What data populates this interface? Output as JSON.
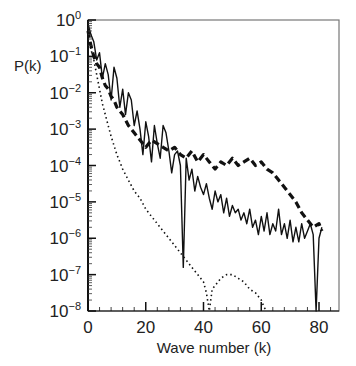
{
  "chart_data": {
    "type": "line",
    "title": "",
    "xlabel": "Wave number (k)",
    "ylabel": "P(k)",
    "xlim": [
      0,
      87
    ],
    "ylim_log10": [
      -8,
      0
    ],
    "yscale": "log",
    "grid": false,
    "legend": null,
    "x_ticks": [
      0,
      20,
      40,
      60,
      80
    ],
    "x_tick_labels": [
      "0",
      "20",
      "40",
      "60",
      "80"
    ],
    "y_ticks_log10": [
      0,
      -1,
      -2,
      -3,
      -4,
      -5,
      -6,
      -7,
      -8
    ],
    "y_tick_labels": [
      "10^0",
      "10^-1",
      "10^-2",
      "10^-3",
      "10^-4",
      "10^-5",
      "10^-6",
      "10^-7",
      "10^-8"
    ],
    "series": [
      {
        "name": "solid",
        "style": "solid",
        "color": "#111111",
        "x": [
          0,
          1,
          2,
          3,
          4,
          5,
          6,
          7,
          8,
          9,
          10,
          11,
          12,
          13,
          14,
          15,
          16,
          17,
          18,
          19,
          20,
          21,
          22,
          23,
          24,
          25,
          26,
          27,
          28,
          29,
          30,
          31,
          32,
          33,
          34,
          35,
          36,
          37,
          38,
          39,
          40,
          41,
          42,
          43,
          44,
          45,
          46,
          47,
          48,
          49,
          50,
          51,
          52,
          53,
          54,
          55,
          56,
          57,
          58,
          59,
          60,
          61,
          62,
          63,
          64,
          65,
          66,
          67,
          68,
          69,
          70,
          71,
          72,
          73,
          74,
          75,
          76,
          77,
          78,
          79,
          80,
          81
        ],
        "log10_y": [
          -0.1,
          -0.4,
          -0.6,
          -1.1,
          -0.9,
          -1.6,
          -1.2,
          -1.5,
          -2.2,
          -1.3,
          -1.6,
          -2.4,
          -1.9,
          -2.6,
          -2.0,
          -2.2,
          -2.9,
          -2.5,
          -3.0,
          -3.7,
          -2.8,
          -3.2,
          -3.9,
          -2.9,
          -3.4,
          -3.8,
          -2.9,
          -3.1,
          -3.6,
          -4.2,
          -3.7,
          -3.6,
          -4.0,
          -6.8,
          -3.8,
          -4.4,
          -4.1,
          -4.7,
          -4.3,
          -4.6,
          -4.8,
          -4.5,
          -4.9,
          -5.2,
          -4.7,
          -5.0,
          -4.8,
          -5.3,
          -4.9,
          -5.4,
          -5.1,
          -5.3,
          -5.2,
          -5.5,
          -5.3,
          -5.6,
          -5.2,
          -5.7,
          -5.5,
          -5.9,
          -5.4,
          -5.8,
          -5.3,
          -5.9,
          -5.6,
          -5.8,
          -5.2,
          -5.9,
          -5.6,
          -6.0,
          -5.5,
          -6.1,
          -5.7,
          -6.1,
          -5.6,
          -6.0,
          -5.8,
          -5.6,
          -5.9,
          -8.0,
          -6.0,
          -5.7
        ]
      },
      {
        "name": "dashed",
        "style": "dashed",
        "color": "#111111",
        "x": [
          0,
          1,
          2,
          3,
          4,
          5,
          6,
          7,
          8,
          9,
          10,
          12,
          14,
          16,
          18,
          20,
          22,
          24,
          26,
          28,
          30,
          32,
          34,
          36,
          38,
          40,
          42,
          44,
          46,
          48,
          50,
          52,
          54,
          56,
          58,
          60,
          62,
          64,
          66,
          68,
          70,
          72,
          74,
          76,
          78,
          80,
          81
        ],
        "log10_y": [
          -0.3,
          -0.7,
          -1.0,
          -1.2,
          -1.3,
          -1.6,
          -1.8,
          -1.9,
          -2.1,
          -2.2,
          -2.4,
          -2.6,
          -2.9,
          -3.1,
          -3.3,
          -3.5,
          -3.3,
          -3.4,
          -3.5,
          -3.6,
          -3.5,
          -3.7,
          -3.8,
          -3.6,
          -3.9,
          -3.7,
          -3.9,
          -4.1,
          -3.9,
          -4.0,
          -3.8,
          -4.0,
          -3.9,
          -3.8,
          -4.0,
          -3.9,
          -4.1,
          -4.2,
          -4.4,
          -4.6,
          -4.8,
          -5.0,
          -5.3,
          -5.5,
          -5.7,
          -5.6,
          -5.8
        ]
      },
      {
        "name": "dotted",
        "style": "dotted",
        "color": "#111111",
        "x": [
          0,
          1,
          2,
          3,
          4,
          5,
          6,
          8,
          10,
          12,
          14,
          16,
          18,
          20,
          22,
          24,
          26,
          28,
          30,
          32,
          34,
          36,
          38,
          40,
          41,
          42,
          43,
          44,
          46,
          48,
          50,
          52,
          54,
          56,
          58,
          60,
          61,
          62
        ],
        "log10_y": [
          -0.5,
          -0.8,
          -1.1,
          -1.5,
          -1.9,
          -2.3,
          -2.6,
          -3.2,
          -3.7,
          -4.1,
          -4.4,
          -4.7,
          -4.9,
          -5.2,
          -5.4,
          -5.6,
          -5.8,
          -6.0,
          -6.2,
          -6.4,
          -6.6,
          -6.8,
          -7.0,
          -7.2,
          -7.5,
          -8.0,
          -7.4,
          -7.3,
          -7.1,
          -7.0,
          -7.0,
          -7.1,
          -7.2,
          -7.4,
          -7.5,
          -7.7,
          -7.9,
          -8.0
        ]
      }
    ]
  },
  "ylabel": "P(k)",
  "xlabel": "Wave number (k)"
}
